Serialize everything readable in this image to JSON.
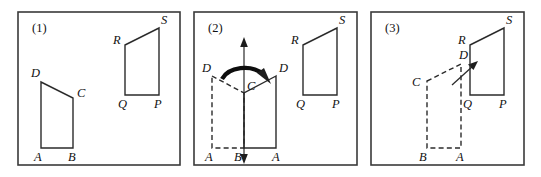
{
  "figure": {
    "width": 541,
    "height": 177,
    "background_color": "#ffffff",
    "stroke_color": "#2b2b2b",
    "frame_color": "#3a3a3a"
  },
  "panels": [
    {
      "id": "panel-1",
      "number_label": "(1)",
      "frame": {
        "x": 18,
        "y": 12,
        "width": 162,
        "height": 153
      },
      "description": "Original quadrilateral ABCD at left and target quadrilateral PQRS at right",
      "shapes": [
        {
          "id": "shape-abcd-1",
          "name": "quadrilateral-abcd",
          "style": "solid",
          "points": "41,82 73,98 73,148 41,148",
          "closed": true,
          "vertices": [
            {
              "label": "A",
              "x": 41,
              "y": 148,
              "label_x": 34,
              "label_y": 161
            },
            {
              "label": "B",
              "x": 73,
              "y": 148,
              "label_x": 68,
              "label_y": 161
            },
            {
              "label": "C",
              "x": 73,
              "y": 98,
              "label_x": 77,
              "label_y": 97
            },
            {
              "label": "D",
              "x": 41,
              "y": 82,
              "label_x": 31,
              "label_y": 77
            }
          ]
        },
        {
          "id": "shape-pqrs-1",
          "name": "quadrilateral-pqrs",
          "style": "solid",
          "points": "125,45 159,28 159,95 125,95",
          "closed": true,
          "vertices": [
            {
              "label": "Q",
              "x": 125,
              "y": 95,
              "label_x": 118,
              "label_y": 108
            },
            {
              "label": "P",
              "x": 159,
              "y": 95,
              "label_x": 154,
              "label_y": 108
            },
            {
              "label": "S",
              "x": 159,
              "y": 28,
              "label_x": 161,
              "label_y": 24
            },
            {
              "label": "R",
              "x": 125,
              "y": 45,
              "label_x": 113,
              "label_y": 44
            }
          ]
        }
      ]
    },
    {
      "id": "panel-2",
      "number_label": "(2)",
      "frame": {
        "x": 194,
        "y": 12,
        "width": 163,
        "height": 153
      },
      "description": "Reflection step: dashed original ABCD flipped across vertical mirror line to solid image, with curved rotation arrow",
      "shapes": [
        {
          "id": "shape-abcd-2-dashed",
          "name": "quadrilateral-abcd-reflected-source",
          "style": "dashed",
          "points": "212,76 244,93 244,148 212,148",
          "closed": true,
          "vertices": [
            {
              "label": "A",
              "x": 212,
              "y": 148,
              "label_x": 205,
              "label_y": 161
            },
            {
              "label": "D",
              "x": 212,
              "y": 76,
              "label_x": 202,
              "label_y": 72
            }
          ]
        },
        {
          "id": "shape-abcd-2-solid",
          "name": "quadrilateral-abcd-reflected-image",
          "style": "solid",
          "points": "276,76 244,93 244,148 276,148",
          "closed": true,
          "vertices": [
            {
              "label": "D",
              "x": 276,
              "y": 76,
              "label_x": 279,
              "label_y": 72
            },
            {
              "label": "A",
              "x": 276,
              "y": 148,
              "label_x": 272,
              "label_y": 161
            },
            {
              "label": "C",
              "x": 244,
              "y": 93,
              "label_x": 247,
              "label_y": 90
            },
            {
              "label": "B",
              "x": 244,
              "y": 148,
              "label_x": 236,
              "label_y": 161
            }
          ]
        },
        {
          "id": "shape-pqrs-2",
          "name": "quadrilateral-pqrs",
          "style": "solid",
          "points": "303,45 337,28 337,95 303,95",
          "closed": true,
          "vertices": [
            {
              "label": "Q",
              "x": 303,
              "y": 95,
              "label_x": 296,
              "label_y": 108
            },
            {
              "label": "P",
              "x": 337,
              "y": 95,
              "label_x": 332,
              "label_y": 108
            },
            {
              "label": "S",
              "x": 337,
              "y": 28,
              "label_x": 339,
              "label_y": 24
            },
            {
              "label": "R",
              "x": 303,
              "y": 45,
              "label_x": 291,
              "label_y": 44
            }
          ]
        }
      ],
      "annotations": [
        {
          "id": "mirror-axis-2",
          "name": "mirror-line",
          "type": "double-arrow-vertical",
          "x": 244,
          "y_top": 40,
          "y_bottom": 160
        },
        {
          "id": "flip-arrow-2",
          "name": "flip-rotation-arrow",
          "type": "curved-arrow",
          "direction": "clockwise-right"
        }
      ]
    },
    {
      "id": "panel-3",
      "number_label": "(3)",
      "frame": {
        "x": 371,
        "y": 12,
        "width": 153,
        "height": 153
      },
      "description": "Translation step: dashed reflected quadrilateral slides up-right along arrow onto solid PQRS",
      "shapes": [
        {
          "id": "shape-abcd-3-dashed",
          "name": "quadrilateral-abcd-translated-source",
          "style": "dashed",
          "points": "427,81 461,64 461,148 427,148",
          "closed": true,
          "vertices": [
            {
              "label": "C",
              "x": 427,
              "y": 81,
              "label_x": 414,
              "label_y": 85
            },
            {
              "label": "D",
              "x": 461,
              "y": 64,
              "label_x": 460,
              "label_y": 59
            },
            {
              "label": "A",
              "x": 461,
              "y": 148,
              "label_x": 456,
              "label_y": 161
            },
            {
              "label": "B",
              "x": 427,
              "y": 148,
              "label_x": 420,
              "label_y": 161
            }
          ]
        },
        {
          "id": "shape-pqrs-3",
          "name": "quadrilateral-pqrs",
          "style": "solid",
          "points": "470,45 504,28 504,95 470,95",
          "closed": true,
          "vertices": [
            {
              "label": "Q",
              "x": 470,
              "y": 95,
              "label_x": 463,
              "label_y": 108
            },
            {
              "label": "P",
              "x": 504,
              "y": 95,
              "label_x": 499,
              "label_y": 108
            },
            {
              "label": "S",
              "x": 504,
              "y": 28,
              "label_x": 506,
              "label_y": 24
            },
            {
              "label": "R",
              "x": 470,
              "y": 45,
              "label_x": 458,
              "label_y": 44
            }
          ]
        }
      ],
      "annotations": [
        {
          "id": "translate-arrow-3",
          "name": "translation-arrow",
          "type": "straight-arrow",
          "from_x": 455,
          "from_y": 83,
          "to_x": 476,
          "to_y": 64
        }
      ]
    }
  ]
}
